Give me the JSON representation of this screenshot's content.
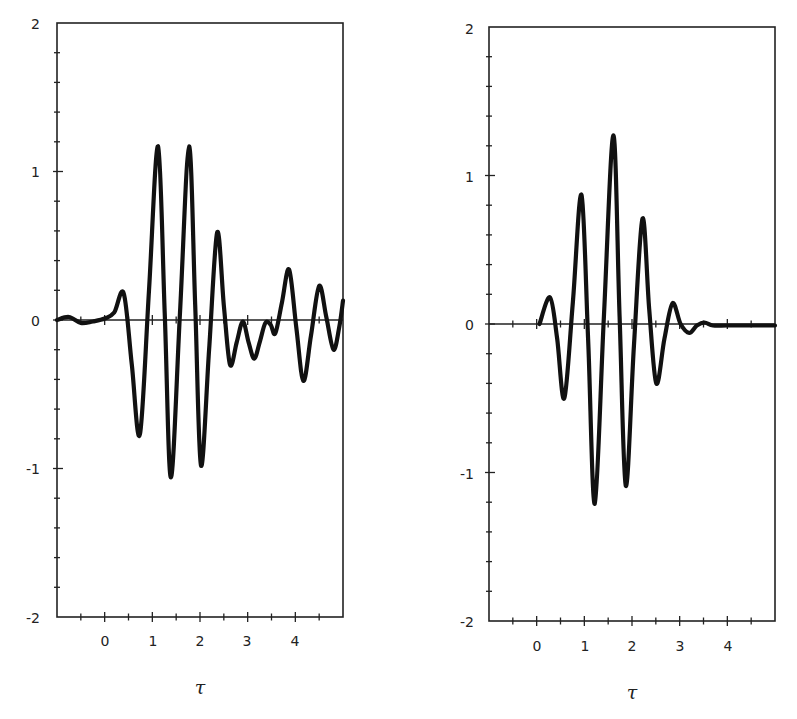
{
  "chart_data": [
    {
      "type": "line",
      "panel": "left",
      "title": "",
      "xlabel": "τ",
      "ylabel": "",
      "xlim": [
        -1,
        5
      ],
      "ylim": [
        -2,
        2
      ],
      "xticks_major": [
        0,
        1,
        2,
        3,
        4
      ],
      "xtick_labels": [
        "0",
        "1",
        "2",
        "3",
        "4"
      ],
      "yticks_major": [
        -2,
        -1,
        0,
        1,
        2
      ],
      "ytick_labels": [
        "-2",
        "-1",
        "0",
        "1",
        "2"
      ],
      "minor_tick_step_x": 0.5,
      "minor_tick_step_y": 0.2,
      "grid": false,
      "zero_line": true,
      "series": [
        {
          "name": "waveform",
          "x": [
            -1.0,
            -0.75,
            -0.5,
            -0.25,
            0.0,
            0.2,
            0.4,
            0.57,
            0.74,
            0.93,
            1.12,
            1.26,
            1.39,
            1.58,
            1.77,
            1.9,
            2.02,
            2.19,
            2.36,
            2.5,
            2.63,
            2.77,
            2.9,
            3.02,
            3.14,
            3.26,
            3.37,
            3.48,
            3.58,
            3.72,
            3.87,
            4.02,
            4.17,
            4.33,
            4.5,
            4.65,
            4.8,
            4.92,
            5.0
          ],
          "y": [
            0.0,
            0.02,
            -0.02,
            -0.01,
            0.01,
            0.05,
            0.18,
            -0.3,
            -0.77,
            0.2,
            1.17,
            0.05,
            -1.06,
            0.05,
            1.17,
            0.1,
            -0.98,
            -0.2,
            0.59,
            0.1,
            -0.3,
            -0.15,
            -0.01,
            -0.15,
            -0.26,
            -0.14,
            -0.02,
            -0.03,
            -0.09,
            0.12,
            0.34,
            -0.05,
            -0.41,
            -0.1,
            0.23,
            0.02,
            -0.2,
            -0.05,
            0.13
          ]
        }
      ]
    },
    {
      "type": "line",
      "panel": "right",
      "title": "",
      "xlabel": "τ",
      "ylabel": "",
      "xlim": [
        -1,
        5
      ],
      "ylim": [
        -2,
        2
      ],
      "xticks_major": [
        0,
        1,
        2,
        3,
        4
      ],
      "xtick_labels": [
        "0",
        "1",
        "2",
        "3",
        "4"
      ],
      "yticks_major": [
        -2,
        -1,
        0,
        1,
        2
      ],
      "ytick_labels": [
        "-2",
        "-1",
        "0",
        "1",
        "2"
      ],
      "minor_tick_step_x": 0.5,
      "minor_tick_step_y": 0.2,
      "grid": false,
      "zero_line": true,
      "series": [
        {
          "name": "waveform",
          "x": [
            0.06,
            0.28,
            0.43,
            0.58,
            0.76,
            0.94,
            1.08,
            1.22,
            1.41,
            1.61,
            1.74,
            1.87,
            2.04,
            2.22,
            2.36,
            2.51,
            2.68,
            2.85,
            3.02,
            3.2,
            3.36,
            3.52,
            3.7,
            4.0,
            4.5,
            5.0
          ],
          "y": [
            0.0,
            0.18,
            -0.1,
            -0.5,
            0.15,
            0.87,
            -0.1,
            -1.21,
            0.05,
            1.27,
            0.05,
            -1.09,
            -0.15,
            0.71,
            0.1,
            -0.4,
            -0.1,
            0.14,
            0.0,
            -0.06,
            -0.01,
            0.01,
            -0.01,
            -0.01,
            -0.01,
            -0.01
          ]
        }
      ]
    }
  ],
  "panels": {
    "left": {
      "xlabel": "τ",
      "ytick_labels": [
        "2",
        "1",
        "0",
        "-1",
        "-2"
      ],
      "xtick_labels": [
        "0",
        "1",
        "2",
        "3",
        "4"
      ]
    },
    "right": {
      "xlabel": "τ",
      "ytick_labels": [
        "2",
        "1",
        "0",
        "-1",
        "-2"
      ],
      "xtick_labels": [
        "0",
        "1",
        "2",
        "3",
        "4"
      ]
    }
  }
}
